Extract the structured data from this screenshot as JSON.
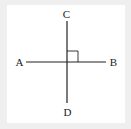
{
  "diagram": {
    "type": "perpendicular-lines",
    "points": {
      "A": {
        "label": "A",
        "x": 19.5,
        "y": 66
      },
      "B": {
        "label": "B",
        "x": 113.5,
        "y": 66
      },
      "C": {
        "label": "C",
        "x": 66.5,
        "y": 18
      },
      "D": {
        "label": "D",
        "x": 67.5,
        "y": 116
      }
    },
    "lines": [
      {
        "name": "AB",
        "from": "A",
        "to": "B",
        "x1": 26,
        "y1": 62,
        "x2": 106,
        "y2": 62
      },
      {
        "name": "CD",
        "from": "C",
        "to": "D",
        "x1": 67,
        "y1": 21,
        "x2": 67,
        "y2": 103
      }
    ],
    "intersection": {
      "x": 67,
      "y": 62
    },
    "right_angle_marker": {
      "x": 67,
      "y": 51,
      "size": 11,
      "quadrant": "upper-right"
    },
    "colors": {
      "stroke": "#222222",
      "background": "#ffffff",
      "border": "#eeeeee"
    }
  }
}
